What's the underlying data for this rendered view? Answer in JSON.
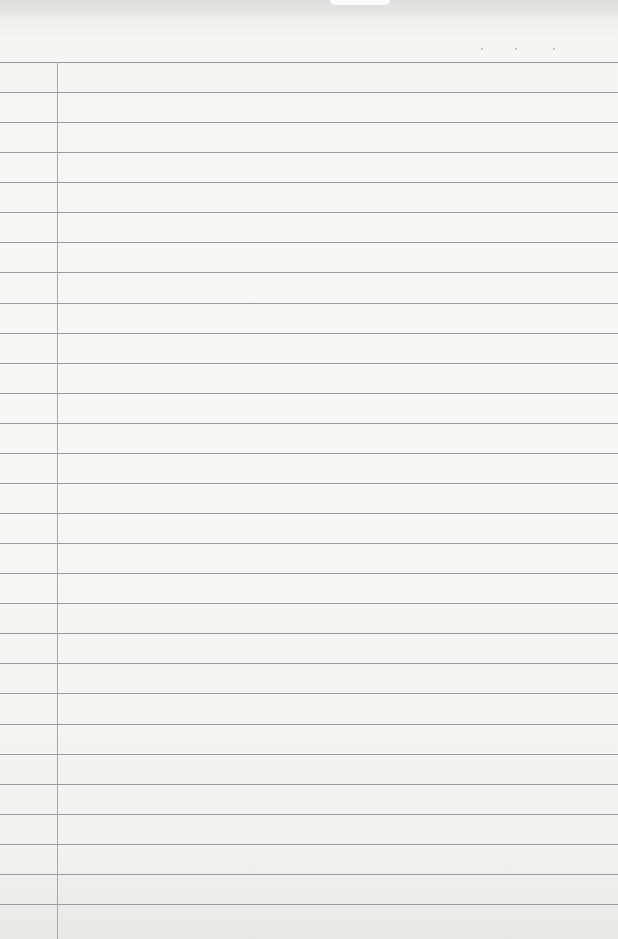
{
  "paper": {
    "type": "blank ruled notebook page",
    "ruled_line_count": 29,
    "has_margin_line": true,
    "text_content": "",
    "colors": {
      "paper": "#f5f5f4",
      "rule_line": "#9b9b9b",
      "margin_line": "#a8a8a8"
    }
  }
}
